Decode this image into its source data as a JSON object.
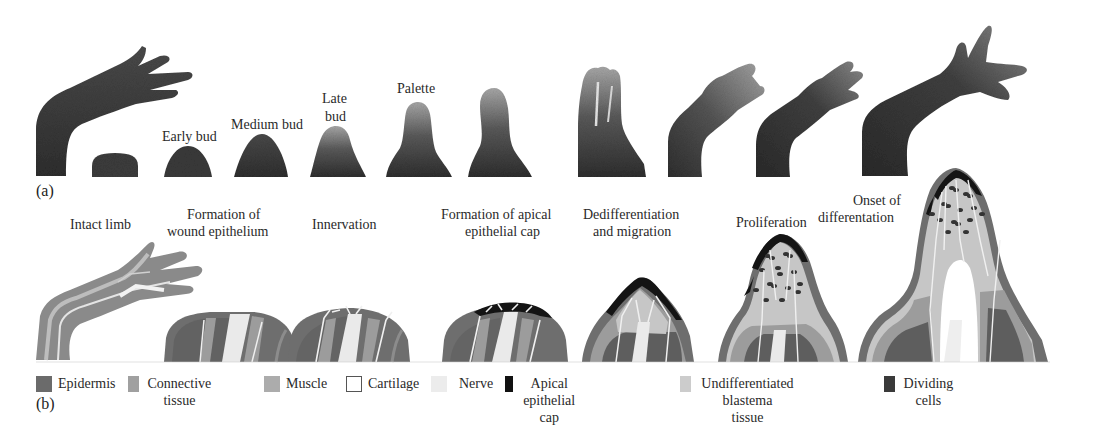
{
  "figure": {
    "panel_a": {
      "label": "(a)",
      "stage_labels": {
        "early_bud": "Early bud",
        "medium_bud": "Medium bud",
        "late_bud_line1": "Late",
        "late_bud_line2": "bud",
        "palette": "Palette"
      },
      "photos": [
        {
          "name": "intact-limb-photo"
        },
        {
          "name": "wound-stump-photo"
        },
        {
          "name": "early-bud-photo"
        },
        {
          "name": "medium-bud-photo"
        },
        {
          "name": "late-bud-photo"
        },
        {
          "name": "palette-photo"
        },
        {
          "name": "elongation-photo"
        },
        {
          "name": "digit-formation-photo"
        },
        {
          "name": "digit-outgrowth-photo"
        },
        {
          "name": "late-regenerate-photo"
        },
        {
          "name": "fully-regenerated-limb-photo"
        }
      ]
    },
    "panel_b": {
      "label": "(b)",
      "stages": [
        {
          "line1": "Intact limb",
          "line2": ""
        },
        {
          "line1": "Formation of",
          "line2": "wound epithelium"
        },
        {
          "line1": "Innervation",
          "line2": ""
        },
        {
          "line1": "Formation of apical",
          "line2": "epithelial cap"
        },
        {
          "line1": "Dedifferentiation",
          "line2": "and migration"
        },
        {
          "line1": "Proliferation",
          "line2": ""
        },
        {
          "line1": "Onset of",
          "line2": "differentation"
        }
      ]
    },
    "legend": [
      {
        "label": "Epidermis",
        "color": "#6b6b6b"
      },
      {
        "label": "Connective tissue",
        "color": "#9a9a9a"
      },
      {
        "label": "Muscle",
        "color": "#a8a8a8"
      },
      {
        "label": "Cartilage",
        "color": "#ffffff"
      },
      {
        "label": "Nerve",
        "color": "#ececec"
      },
      {
        "label": "Apical epithelial cap",
        "color": "#111111"
      },
      {
        "label": "Undifferentiated blastema",
        "label2": "tissue",
        "color": "#c8c8c8"
      },
      {
        "label": "Dividing cells",
        "color": "#3a3a3a"
      }
    ],
    "colors": {
      "epidermis": "#707070",
      "connective": "#9b9b9b",
      "muscle": "#5f5f5f",
      "cartilage": "#ffffff",
      "nerve": "#e8e8e8",
      "aec": "#141414",
      "blastema": "#c6c6c6",
      "dividing": "#333333",
      "photo_dark": "#3a3a3a",
      "photo_light": "#9a9a9a"
    }
  }
}
